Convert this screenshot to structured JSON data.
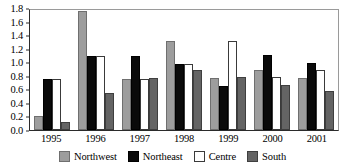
{
  "chart_data": {
    "type": "bar",
    "title": "",
    "subtitle": "",
    "xlabel": "",
    "ylabel": "",
    "categories": [
      "1995",
      "1996",
      "1997",
      "1998",
      "1999",
      "2000",
      "2001"
    ],
    "series": [
      {
        "name": "Northwest",
        "color": "#9d9d9d",
        "values": [
          0.21,
          1.75,
          0.76,
          1.32,
          0.77,
          0.89,
          0.77
        ]
      },
      {
        "name": "Northeast",
        "color": "#0a0a0a",
        "values": [
          0.76,
          1.09,
          1.09,
          0.98,
          0.65,
          1.11,
          0.99
        ]
      },
      {
        "name": "Centre",
        "color": "#ffffff",
        "values": [
          0.76,
          1.09,
          0.76,
          0.97,
          1.32,
          0.78,
          0.89
        ]
      },
      {
        "name": "South",
        "color": "#646464",
        "values": [
          0.12,
          0.54,
          0.77,
          0.88,
          0.78,
          0.66,
          0.57
        ]
      }
    ],
    "ylim": [
      0.0,
      1.8
    ],
    "yticks": [
      "0.0",
      "0.2",
      "0.4",
      "0.6",
      "0.8",
      "1.0",
      "1.2",
      "1.4",
      "1.6",
      "1.8"
    ],
    "ytick_values": [
      0.0,
      0.2,
      0.4,
      0.6,
      0.8,
      1.0,
      1.2,
      1.4,
      1.6,
      1.8
    ],
    "grid": false,
    "legend_position": "bottom"
  },
  "legend": {
    "items": [
      {
        "label": "Northwest"
      },
      {
        "label": "Northeast"
      },
      {
        "label": "Centre"
      },
      {
        "label": "South"
      }
    ]
  }
}
